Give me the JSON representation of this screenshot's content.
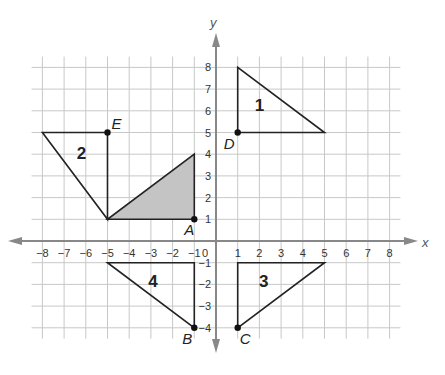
{
  "diagram": {
    "type": "coordinate-plane",
    "axes": {
      "x_label": "x",
      "y_label": "y",
      "x_range": [
        -8,
        8
      ],
      "y_range": [
        -4,
        8
      ],
      "x_ticks": [
        "-8",
        "-7",
        "-6",
        "-5",
        "-4",
        "-3",
        "-2",
        "-1",
        "0",
        "1",
        "2",
        "3",
        "4",
        "5",
        "6",
        "7",
        "8"
      ],
      "y_ticks": [
        "8",
        "7",
        "6",
        "5",
        "4",
        "3",
        "2",
        "1",
        "-1",
        "-2",
        "-3",
        "-4"
      ],
      "origin_label": "0"
    },
    "colors": {
      "grid": "#c8c8c8",
      "axis": "#888888",
      "shape_stroke": "#222222",
      "shaded_fill": "#c4c4c4"
    },
    "shaded_triangle": {
      "vertices": [
        [
          -5,
          1
        ],
        [
          -1,
          1
        ],
        [
          -1,
          4
        ]
      ]
    },
    "figures": [
      {
        "label": "1",
        "vertices": [
          [
            1,
            5
          ],
          [
            1,
            8
          ],
          [
            5,
            5
          ]
        ],
        "label_pos": [
          2,
          6
        ]
      },
      {
        "label": "2",
        "vertices": [
          [
            -5,
            1
          ],
          [
            -5,
            5
          ],
          [
            -8,
            5
          ]
        ],
        "label_pos": [
          -6.2,
          3.8
        ]
      },
      {
        "label": "3",
        "vertices": [
          [
            1,
            -4
          ],
          [
            1,
            -1
          ],
          [
            5,
            -1
          ]
        ],
        "label_pos": [
          2.2,
          -2.1
        ]
      },
      {
        "label": "4",
        "vertices": [
          [
            -1,
            -4
          ],
          [
            -1,
            -1
          ],
          [
            -5,
            -1
          ]
        ],
        "label_pos": [
          -2.9,
          -2.1
        ]
      }
    ],
    "points": [
      {
        "label": "A",
        "coord": [
          -1,
          1
        ]
      },
      {
        "label": "B",
        "coord": [
          -1,
          -4
        ]
      },
      {
        "label": "C",
        "coord": [
          1,
          -4
        ]
      },
      {
        "label": "D",
        "coord": [
          1,
          5
        ]
      },
      {
        "label": "E",
        "coord": [
          -5,
          5
        ]
      }
    ]
  }
}
